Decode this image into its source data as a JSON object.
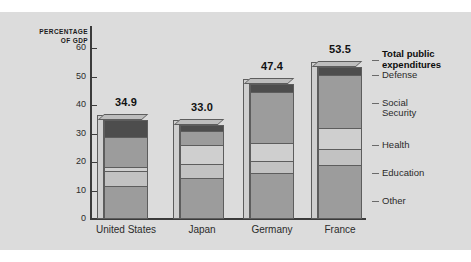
{
  "chart_data": {
    "type": "bar",
    "subtype": "stacked-bar",
    "title": "",
    "xlabel": "",
    "ylabel": "PERCENTAGE\nOF GDP",
    "ylabel_line1": "PERCENTAGE",
    "ylabel_line2": "OF GDP",
    "ylim": [
      0,
      60
    ],
    "yticks": [
      0,
      10,
      20,
      30,
      40,
      50,
      60
    ],
    "ytick_labels": [
      "0",
      "10",
      "20",
      "30",
      "40",
      "50",
      "60"
    ],
    "grid": false,
    "legend_position": "right",
    "categories": [
      "United States",
      "Japan",
      "Germany",
      "France"
    ],
    "totals": [
      34.9,
      33.0,
      47.4,
      53.5
    ],
    "total_labels": [
      "34.9",
      "33.0",
      "47.4",
      "53.5"
    ],
    "series": [
      {
        "name": "Other",
        "color": "#9c9c9c",
        "values": [
          11.5,
          14.3,
          16.0,
          19.0
        ]
      },
      {
        "name": "Education",
        "color": "#c2c2c2",
        "values": [
          5.4,
          5.0,
          4.4,
          5.7
        ]
      },
      {
        "name": "Health",
        "color": "#cfcfcf",
        "values": [
          1.3,
          6.6,
          6.4,
          7.2
        ]
      },
      {
        "name": "Social Security",
        "color": "#9c9c9c",
        "values": [
          10.5,
          5.1,
          17.6,
          18.6
        ]
      },
      {
        "name": "Defense",
        "color": "#4d4d4d",
        "values": [
          6.2,
          2.0,
          3.0,
          3.0
        ]
      }
    ],
    "stack_order_bottom_to_top": [
      "Other",
      "Education",
      "Health",
      "Social Security",
      "Defense"
    ]
  },
  "legend": {
    "items": [
      {
        "label": "Total public\nexpenditures",
        "emphasis": true
      },
      {
        "label": "Defense",
        "emphasis": false
      },
      {
        "label": "Social\nSecurity",
        "emphasis": false
      },
      {
        "label": "Health",
        "emphasis": false
      },
      {
        "label": "Education",
        "emphasis": false
      },
      {
        "label": "Other",
        "emphasis": false
      }
    ]
  },
  "colors": {
    "plate_background": "#dcdcdc",
    "page_background": "#ffffff",
    "axis": "#3b3b3b",
    "text": "#2b2b2b",
    "bar_outline": "#5d5d5d",
    "bar_side": "#cfcfcf"
  }
}
